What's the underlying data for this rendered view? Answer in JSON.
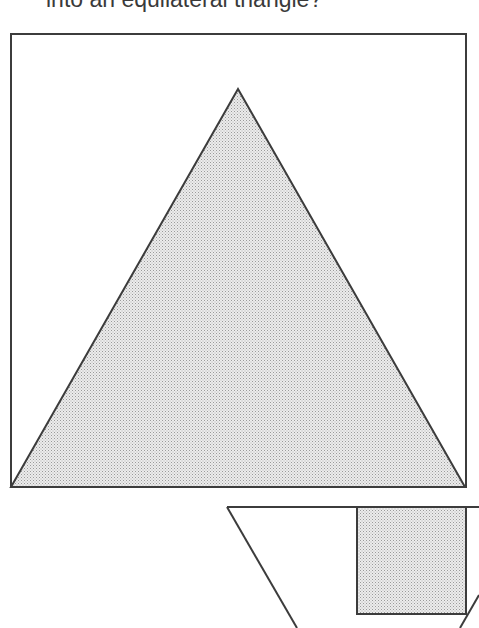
{
  "caption": {
    "text": "into an equilateral triangle?"
  },
  "colors": {
    "stroke": "#3c3c3c",
    "fill_stipple": "#d6d6d6",
    "background": "#ffffff"
  },
  "figure": {
    "square": {
      "x": 11,
      "y": 34,
      "width": 455,
      "height": 453
    },
    "triangle": {
      "points": [
        [
          238,
          89
        ],
        [
          11,
          487
        ],
        [
          465,
          487
        ]
      ],
      "fill": "stippled"
    },
    "lower_shape": {
      "top_edge": [
        [
          227,
          507
        ],
        [
          479,
          507
        ]
      ],
      "left_diagonal": [
        [
          227,
          507
        ],
        [
          297,
          628
        ]
      ],
      "right_diagonal": [
        [
          479,
          595
        ],
        [
          460,
          628
        ]
      ],
      "shaded_square": {
        "x": 357,
        "y": 507,
        "width": 109,
        "height": 107,
        "fill": "stippled"
      }
    }
  }
}
